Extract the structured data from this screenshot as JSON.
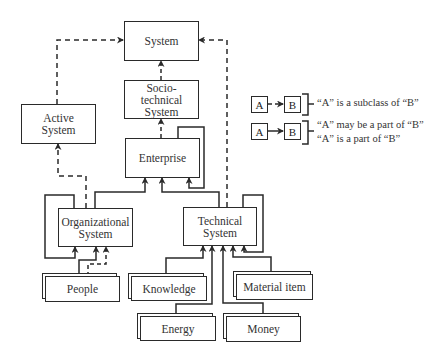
{
  "nodes": {
    "system": "System",
    "socio_technical": "Socio-\ntechnical\nSystem",
    "active_system": "Active\nSystem",
    "enterprise": "Enterprise",
    "organizational_system": "Organizational\nSystem",
    "technical_system": "Technical\nSystem",
    "people": "People",
    "knowledge": "Knowledge",
    "material_item": "Material item",
    "energy": "Energy",
    "money": "Money"
  },
  "legend": {
    "a_label": "A",
    "b_label": "B",
    "subclass_text": "“A” is a subclass of “B”",
    "may_be_part_text": "“A” may be a part of “B”",
    "is_part_text": "“A” is a part of “B”"
  },
  "colors": {
    "line": "#2a2a2a",
    "background": "#ffffff"
  }
}
